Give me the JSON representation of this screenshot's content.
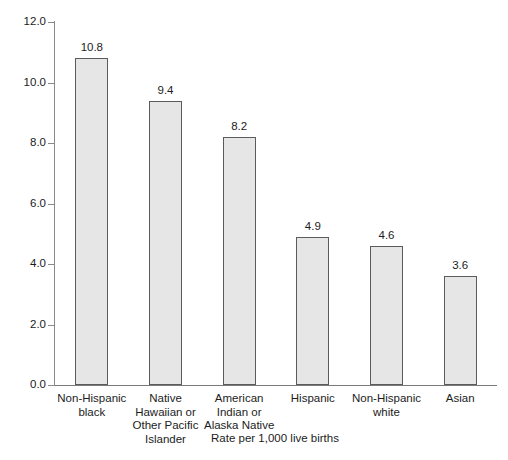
{
  "chart_data": {
    "type": "bar",
    "title": "",
    "subtitle": "",
    "xlabel": "Rate per 1,000 live births",
    "ylabel": "",
    "ylim": [
      0.0,
      12.0
    ],
    "ytick_values": [
      12.0,
      10.0,
      8.0,
      6.0,
      4.0,
      2.0,
      0.0
    ],
    "ytick_labels": [
      "12.0",
      "10.0",
      "8.0",
      "6.0",
      "4.0",
      "2.0",
      "0.0"
    ],
    "grid": false,
    "legend": false,
    "legend_position": "none",
    "categories": [
      "Non-Hispanic\nblack",
      "Native\nHawaiian or\nOther Pacific\nIslander",
      "American\nIndian or\nAlaska Native",
      "Hispanic",
      "Non-Hispanic\nwhite",
      "Asian"
    ],
    "values": [
      10.8,
      9.4,
      8.2,
      4.9,
      4.6,
      3.6
    ],
    "value_labels": [
      "10.8",
      "9.4",
      "8.2",
      "4.9",
      "4.6",
      "3.6"
    ],
    "bar_fill_color": "#e6e6e6",
    "bar_edge_color": "#5b5b5b",
    "axis_color": "#8a8a8a",
    "text_color": "#1c1c1c",
    "background_color": "#ffffff"
  }
}
